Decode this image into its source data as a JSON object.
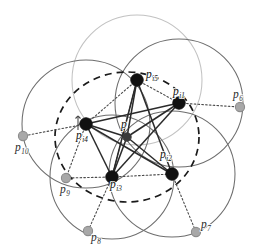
{
  "figure": {
    "width": 262,
    "height": 251,
    "background": "#ffffff"
  },
  "style": {
    "black_point_color": "#111111",
    "gray_point_color": "#a8a8a8",
    "gray_point_ring": "#8d8d8d",
    "center_point_color": "#3a3a3a",
    "solid_circle_color": "#6e6e6e",
    "pale_circle_color": "#c2c2c2",
    "dashed_circle_color": "#1a1a1a",
    "solid_edge_color": "#2b2b2b",
    "dotted_edge_color": "#4a4a4a",
    "label_color": "#111111"
  },
  "center_point": {
    "id": "p",
    "label": "p",
    "sub": "",
    "x": 127,
    "y": 137,
    "r": 4.2,
    "label_x": 121,
    "label_y": 128
  },
  "dashed_circle": {
    "cx": 127,
    "cy": 137,
    "rx": 72,
    "ry": 65,
    "dash": "7 5"
  },
  "neighbor_points": [
    {
      "id": "pi5",
      "label": "p",
      "sub": "i5",
      "x": 137,
      "y": 80,
      "r": 6.2,
      "label_x": 146,
      "label_y": 78,
      "circle_r": 65,
      "circle_tone": "pale"
    },
    {
      "id": "pi1",
      "label": "p",
      "sub": "i1",
      "x": 179,
      "y": 103,
      "r": 6.2,
      "label_x": 173,
      "label_y": 95,
      "circle_r": 64,
      "circle_tone": "solid"
    },
    {
      "id": "pi2",
      "label": "p",
      "sub": "i2",
      "x": 172,
      "y": 174,
      "r": 6.2,
      "label_x": 160,
      "label_y": 158,
      "circle_r": 63,
      "circle_tone": "solid"
    },
    {
      "id": "pi3",
      "label": "p",
      "sub": "i3",
      "x": 112,
      "y": 177,
      "r": 6.2,
      "label_x": 110,
      "label_y": 188,
      "circle_r": 62,
      "circle_tone": "solid"
    },
    {
      "id": "pi4",
      "label": "p",
      "sub": "i4",
      "x": 86,
      "y": 124,
      "r": 6.2,
      "label_x": 76,
      "label_y": 139,
      "circle_r": 64,
      "circle_tone": "solid"
    }
  ],
  "outer_points": [
    {
      "id": "p6",
      "label": "p",
      "sub": "6",
      "x": 240,
      "y": 107,
      "r": 4.6,
      "label_x": 233,
      "label_y": 98
    },
    {
      "id": "p7",
      "label": "p",
      "sub": "7",
      "x": 196,
      "y": 232,
      "r": 4.6,
      "label_x": 201,
      "label_y": 228
    },
    {
      "id": "p8",
      "label": "p",
      "sub": "8",
      "x": 88,
      "y": 231,
      "r": 4.6,
      "label_x": 91,
      "label_y": 241
    },
    {
      "id": "p9",
      "label": "p",
      "sub": "9",
      "x": 66,
      "y": 178,
      "r": 4.6,
      "label_x": 60,
      "label_y": 193
    },
    {
      "id": "p10",
      "label": "p",
      "sub": "10",
      "x": 23,
      "y": 136,
      "r": 4.6,
      "label_x": 15,
      "label_y": 151
    }
  ],
  "solid_edges": [
    {
      "from": "p",
      "to": "pi5"
    },
    {
      "from": "p",
      "to": "pi1"
    },
    {
      "from": "p",
      "to": "pi2"
    },
    {
      "from": "p",
      "to": "pi3"
    },
    {
      "from": "p",
      "to": "pi4"
    },
    {
      "from": "pi5",
      "to": "pi2"
    },
    {
      "from": "pi5",
      "to": "pi3"
    },
    {
      "from": "pi1",
      "to": "pi3"
    },
    {
      "from": "pi1",
      "to": "pi4"
    },
    {
      "from": "pi2",
      "to": "pi4"
    },
    {
      "from": "pi4",
      "to": "pi3"
    }
  ],
  "dotted_edges": [
    {
      "from": "pi5",
      "to": "pi1"
    },
    {
      "from": "pi1",
      "to": "p6"
    },
    {
      "from": "pi2",
      "to": "p7"
    },
    {
      "from": "pi3",
      "to": "pi2"
    },
    {
      "from": "pi3",
      "to": "p8"
    },
    {
      "from": "pi3",
      "to": "p9"
    },
    {
      "from": "pi4",
      "to": "p9"
    },
    {
      "from": "pi4",
      "to": "p10"
    },
    {
      "from": "pi5",
      "to": "pi4"
    },
    {
      "from": "pi5",
      "to": "pi3"
    }
  ],
  "tick_mark": {
    "x": 78,
    "y1": 116,
    "y2": 130
  }
}
